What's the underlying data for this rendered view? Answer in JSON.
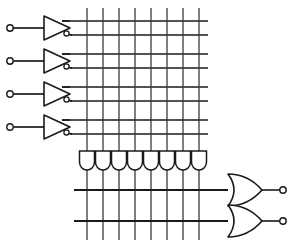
{
  "figure": {
    "type": "logic-circuit-diagram",
    "width": 295,
    "height": 244,
    "background_color": "#ffffff",
    "line_color": "#1a1a1a",
    "grid_line_color": "#3a3a3a"
  },
  "inputs": {
    "count": 4,
    "terminal_shape": "small-open-circle",
    "terminal_radius": 3.2,
    "terminal_x": 10,
    "items": [
      {
        "label": "",
        "terminal_y": 28,
        "lead_from_x": 13,
        "lead_to_x": 44
      },
      {
        "label": "",
        "terminal_y": 61,
        "lead_from_x": 13,
        "lead_to_x": 44
      },
      {
        "label": "",
        "terminal_y": 94,
        "lead_from_x": 13,
        "lead_to_x": 44
      },
      {
        "label": "",
        "terminal_y": 127,
        "lead_from_x": 13,
        "lead_to_x": 44
      }
    ]
  },
  "inverter_buffers": {
    "count": 4,
    "description": "Triangle buffer with inverting bubble producing true and complement lines",
    "apex_x": 70,
    "base_x": 44,
    "half_height": 12,
    "bubble_radius": 2.6,
    "items": [
      {
        "center_y": 28,
        "true_line_y": 21,
        "complement_line_y": 35
      },
      {
        "center_y": 61,
        "true_line_y": 54,
        "complement_line_y": 68
      },
      {
        "center_y": 94,
        "true_line_y": 87,
        "complement_line_y": 101
      },
      {
        "center_y": 127,
        "true_line_y": 120,
        "complement_line_y": 134
      }
    ]
  },
  "and_plane": {
    "description": "Horizontal input/complement lines crossing vertical product-term lines",
    "horizontal_lines": [
      {
        "y": 21,
        "x1": 62,
        "x2": 208
      },
      {
        "y": 35,
        "x1": 70,
        "x2": 208
      },
      {
        "y": 54,
        "x1": 62,
        "x2": 208
      },
      {
        "y": 68,
        "x1": 70,
        "x2": 208
      },
      {
        "y": 87,
        "x1": 62,
        "x2": 208
      },
      {
        "y": 101,
        "x1": 70,
        "x2": 208
      },
      {
        "y": 120,
        "x1": 62,
        "x2": 208
      },
      {
        "y": 134,
        "x1": 70,
        "x2": 208
      }
    ],
    "horizontal_line_count": 8
  },
  "product_terms": {
    "count": 8,
    "vertical_line_top_y": 8,
    "vertical_line_bottom_y": 240,
    "and_gate": {
      "shape": "and-gate-vertical-down",
      "top_y": 151,
      "body_bottom_y": 163,
      "round_bottom_y": 170,
      "half_width": 7.5
    },
    "x_positions": [
      87,
      103,
      119,
      135,
      151,
      167,
      183,
      199
    ]
  },
  "or_plane": {
    "description": "Two horizontal sum lines crossing the product-term vertical lines",
    "horizontal_lines": [
      {
        "y": 190,
        "x1": 74,
        "x2": 228
      },
      {
        "y": 221,
        "x1": 74,
        "x2": 228
      }
    ],
    "horizontal_line_count": 2
  },
  "or_gates": {
    "count": 2,
    "shape": "or-gate",
    "left_x": 228,
    "right_x": 262,
    "half_height": 16,
    "output_terminal_radius": 3.2,
    "items": [
      {
        "label": "",
        "center_y": 190,
        "output_terminal_x": 283,
        "output_lead_from_x": 262,
        "output_lead_to_x": 280
      },
      {
        "label": "",
        "center_y": 221,
        "output_terminal_x": 283,
        "output_lead_from_x": 262,
        "output_lead_to_x": 280
      }
    ]
  },
  "outputs": {
    "count": 2,
    "terminal_shape": "small-open-circle"
  }
}
